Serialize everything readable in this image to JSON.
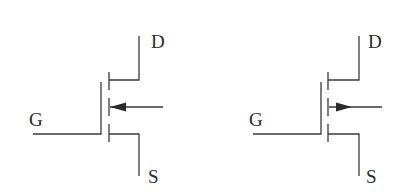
{
  "diagram": {
    "type": "MOSFET symbols (depletion/enhancement style, segmented channel)",
    "colors": {
      "line": "#3a3a3a",
      "text": "#2a2a2a",
      "background": "#ffffff"
    },
    "symbols": [
      {
        "id": "left",
        "arrow_direction": "inward (pointing toward channel)",
        "labels": {
          "drain": "D",
          "gate": "G",
          "source": "S"
        }
      },
      {
        "id": "right",
        "arrow_direction": "outward (pointing away from channel)",
        "labels": {
          "drain": "D",
          "gate": "G",
          "source": "S"
        }
      }
    ]
  }
}
